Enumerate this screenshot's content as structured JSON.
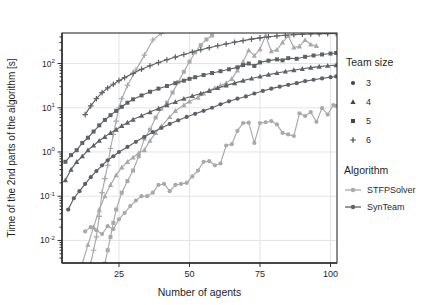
{
  "figure": {
    "width": 429,
    "height": 305,
    "background": "#ffffff",
    "panel_border_color": "#2f2f2f",
    "grid_color": "#e1e1e1",
    "tick_color": "#2f2f2f",
    "text_color": "#1f1f1f"
  },
  "chart_data": {
    "type": "line",
    "title": "",
    "xlabel": "Number of agents",
    "ylabel": "Time of the 2nd parts of the algorithm [s]",
    "x_ticks": [
      25,
      50,
      75,
      100
    ],
    "xlim": [
      4.8,
      102.3
    ],
    "y_scale": "log10",
    "y_tick_exponents": [
      -2,
      -1,
      0,
      1,
      2
    ],
    "ylim_log10": [
      -2.51,
      2.69
    ],
    "grid": "major",
    "legend_position": "right-outside",
    "series": [
      {
        "name": "STFPSolver team 3",
        "algorithm": "STFPSolver",
        "team_size": 3,
        "marker": "circle",
        "color": "#a9a9a9",
        "points": [
          [
            13,
            0.016
          ],
          [
            15,
            0.02
          ],
          [
            17,
            0.017
          ],
          [
            19,
            0.014
          ],
          [
            21,
            0.021
          ],
          [
            23,
            0.018
          ],
          [
            25,
            0.03
          ],
          [
            27,
            0.042
          ],
          [
            29,
            0.06
          ],
          [
            31,
            0.08
          ],
          [
            33,
            0.1
          ],
          [
            35,
            0.1
          ],
          [
            37,
            0.12
          ],
          [
            39,
            0.18
          ],
          [
            41,
            0.19
          ],
          [
            43,
            0.13
          ],
          [
            45,
            0.18
          ],
          [
            47,
            0.19
          ],
          [
            49,
            0.2
          ],
          [
            51,
            0.28
          ],
          [
            53,
            0.38
          ],
          [
            55,
            0.6
          ],
          [
            57,
            0.62
          ],
          [
            59,
            0.5
          ],
          [
            61,
            0.55
          ],
          [
            63,
            1.4
          ],
          [
            65,
            1.5
          ],
          [
            67,
            3
          ],
          [
            69,
            4.5
          ],
          [
            71,
            4.6
          ],
          [
            73,
            1.6
          ],
          [
            75,
            4.5
          ],
          [
            77,
            4.7
          ],
          [
            79,
            5
          ],
          [
            81,
            4.2
          ],
          [
            83,
            2.7
          ],
          [
            85,
            2.5
          ],
          [
            87,
            2.3
          ],
          [
            89,
            7.5
          ],
          [
            91,
            6.5
          ],
          [
            93,
            8
          ],
          [
            95,
            4.8
          ],
          [
            97,
            9.8
          ],
          [
            99,
            7
          ],
          [
            101,
            11.5
          ],
          [
            102,
            11
          ]
        ]
      },
      {
        "name": "STFPSolver team 4",
        "algorithm": "STFPSolver",
        "team_size": 4,
        "marker": "triangle",
        "color": "#a9a9a9",
        "points": [
          [
            12,
            0.003
          ],
          [
            14,
            0.008
          ],
          [
            16,
            0.02
          ],
          [
            18,
            0.05
          ],
          [
            20,
            0.1
          ],
          [
            22,
            0.18
          ],
          [
            24,
            0.3
          ],
          [
            26,
            0.45
          ],
          [
            28,
            0.6
          ],
          [
            30,
            0.75
          ],
          [
            32,
            0.95
          ],
          [
            34,
            1.1
          ],
          [
            36,
            1.8
          ],
          [
            38,
            2.7
          ],
          [
            40,
            3.8
          ],
          [
            43,
            6.2
          ],
          [
            45,
            8.5
          ],
          [
            48,
            11.5
          ],
          [
            50,
            14
          ],
          [
            53,
            17
          ],
          [
            55,
            21
          ],
          [
            57,
            25
          ],
          [
            59,
            28
          ],
          [
            61,
            32
          ],
          [
            63,
            36
          ],
          [
            65,
            45
          ],
          [
            67,
            70
          ],
          [
            69,
            110
          ],
          [
            71,
            200
          ],
          [
            73,
            150
          ],
          [
            75,
            210
          ],
          [
            77,
            430
          ],
          [
            79,
            190
          ],
          [
            81,
            205
          ],
          [
            83,
            300
          ],
          [
            85,
            420
          ],
          [
            87,
            230
          ],
          [
            89,
            245
          ],
          [
            91,
            340
          ],
          [
            93,
            270
          ],
          [
            95,
            250
          ]
        ]
      },
      {
        "name": "STFPSolver team 5",
        "algorithm": "STFPSolver",
        "team_size": 5,
        "marker": "square",
        "color": "#a9a9a9",
        "points": [
          [
            20,
            0.003
          ],
          [
            21,
            0.006
          ],
          [
            22,
            0.012
          ],
          [
            23,
            0.025
          ],
          [
            24,
            0.05
          ],
          [
            26,
            0.12
          ],
          [
            28,
            0.22
          ],
          [
            30,
            0.38
          ],
          [
            32,
            0.8
          ],
          [
            34,
            2
          ],
          [
            36,
            3.2
          ],
          [
            38,
            6
          ],
          [
            40,
            9.5
          ],
          [
            42,
            13
          ],
          [
            44,
            22
          ],
          [
            46,
            38
          ],
          [
            48,
            65
          ],
          [
            50,
            110
          ],
          [
            52,
            180
          ],
          [
            54,
            260
          ],
          [
            56,
            350
          ],
          [
            58,
            430
          ]
        ]
      },
      {
        "name": "STFPSolver team 6",
        "algorithm": "STFPSolver",
        "team_size": 6,
        "marker": "plus",
        "color": "#a9a9a9",
        "points": [
          [
            15,
            0.003
          ],
          [
            16,
            0.006
          ],
          [
            17,
            0.012
          ],
          [
            18,
            0.035
          ],
          [
            19,
            0.12
          ],
          [
            20,
            0.25
          ],
          [
            21,
            0.5
          ],
          [
            22,
            1.2
          ],
          [
            23,
            2.5
          ],
          [
            24,
            5
          ],
          [
            25,
            10
          ],
          [
            26,
            16
          ],
          [
            28,
            32
          ],
          [
            31,
            71
          ],
          [
            34,
            155
          ],
          [
            37,
            340
          ],
          [
            40,
            480
          ]
        ]
      },
      {
        "name": "SynTeam team 3",
        "algorithm": "SynTeam",
        "team_size": 3,
        "marker": "circle",
        "color": "#5e6266",
        "points": [
          [
            7,
            0.05
          ],
          [
            9,
            0.09
          ],
          [
            11,
            0.13
          ],
          [
            13,
            0.19
          ],
          [
            15,
            0.27
          ],
          [
            17,
            0.37
          ],
          [
            19,
            0.5
          ],
          [
            21,
            0.65
          ],
          [
            23,
            0.8
          ],
          [
            25,
            1
          ],
          [
            28,
            1.3
          ],
          [
            31,
            1.7
          ],
          [
            34,
            2.2
          ],
          [
            37,
            2.8
          ],
          [
            40,
            3.5
          ],
          [
            43,
            4.3
          ],
          [
            46,
            5.2
          ],
          [
            49,
            6.2
          ],
          [
            52,
            7.3
          ],
          [
            55,
            8.5
          ],
          [
            58,
            10
          ],
          [
            61,
            12
          ],
          [
            64,
            14
          ],
          [
            67,
            16
          ],
          [
            70,
            18
          ],
          [
            73,
            21
          ],
          [
            76,
            24
          ],
          [
            79,
            27
          ],
          [
            82,
            30
          ],
          [
            85,
            33
          ],
          [
            88,
            36
          ],
          [
            91,
            40
          ],
          [
            94,
            43
          ],
          [
            97,
            46
          ],
          [
            100,
            49
          ],
          [
            102,
            51
          ]
        ]
      },
      {
        "name": "SynTeam team 4",
        "algorithm": "SynTeam",
        "team_size": 4,
        "marker": "triangle",
        "color": "#5e6266",
        "points": [
          [
            6,
            0.23
          ],
          [
            8,
            0.4
          ],
          [
            10,
            0.6
          ],
          [
            12,
            0.8
          ],
          [
            14,
            1.1
          ],
          [
            16,
            1.4
          ],
          [
            18,
            1.8
          ],
          [
            20,
            2.2
          ],
          [
            22,
            2.7
          ],
          [
            24,
            3.2
          ],
          [
            26,
            3.9
          ],
          [
            28,
            4.6
          ],
          [
            30,
            5.4
          ],
          [
            33,
            6.6
          ],
          [
            36,
            8
          ],
          [
            39,
            9.6
          ],
          [
            42,
            11.5
          ],
          [
            45,
            13.5
          ],
          [
            48,
            16
          ],
          [
            51,
            18.5
          ],
          [
            54,
            21
          ],
          [
            57,
            24
          ],
          [
            60,
            28
          ],
          [
            63,
            32
          ],
          [
            66,
            36
          ],
          [
            69,
            41
          ],
          [
            72,
            46
          ],
          [
            75,
            51
          ],
          [
            78,
            56
          ],
          [
            81,
            61
          ],
          [
            84,
            66
          ],
          [
            87,
            71
          ],
          [
            90,
            76
          ],
          [
            93,
            81
          ],
          [
            96,
            85
          ],
          [
            99,
            89
          ],
          [
            102,
            92
          ]
        ]
      },
      {
        "name": "SynTeam team 5",
        "algorithm": "SynTeam",
        "team_size": 5,
        "marker": "square",
        "color": "#5e6266",
        "points": [
          [
            6,
            0.6
          ],
          [
            8,
            0.85
          ],
          [
            10,
            1.1
          ],
          [
            12,
            1.6
          ],
          [
            14,
            2.1
          ],
          [
            16,
            2.9
          ],
          [
            18,
            4
          ],
          [
            20,
            5.3
          ],
          [
            22,
            6.8
          ],
          [
            24,
            8.5
          ],
          [
            26,
            10.5
          ],
          [
            28,
            13
          ],
          [
            30,
            15.5
          ],
          [
            33,
            19
          ],
          [
            36,
            23
          ],
          [
            39,
            27
          ],
          [
            42,
            31
          ],
          [
            45,
            36
          ],
          [
            48,
            41
          ],
          [
            50,
            45
          ],
          [
            52,
            49
          ],
          [
            55,
            55
          ],
          [
            58,
            61
          ],
          [
            61,
            67
          ],
          [
            64,
            74
          ],
          [
            67,
            82
          ],
          [
            69,
            92
          ],
          [
            71,
            100
          ],
          [
            73,
            88
          ],
          [
            75,
            106
          ],
          [
            78,
            116
          ],
          [
            81,
            124
          ],
          [
            83,
            118
          ],
          [
            85,
            132
          ],
          [
            88,
            128
          ],
          [
            91,
            142
          ],
          [
            94,
            152
          ],
          [
            97,
            160
          ],
          [
            100,
            168
          ],
          [
            102,
            173
          ]
        ]
      },
      {
        "name": "SynTeam team 6",
        "algorithm": "SynTeam",
        "team_size": 6,
        "marker": "plus",
        "color": "#5e6266",
        "points": [
          [
            13,
            7
          ],
          [
            15,
            11
          ],
          [
            17,
            16
          ],
          [
            19,
            22
          ],
          [
            21,
            28
          ],
          [
            23,
            34
          ],
          [
            25,
            41
          ],
          [
            27,
            48
          ],
          [
            30,
            60
          ],
          [
            33,
            74
          ],
          [
            36,
            89
          ],
          [
            39,
            105
          ],
          [
            42,
            122
          ],
          [
            45,
            140
          ],
          [
            48,
            160
          ],
          [
            51,
            182
          ],
          [
            54,
            205
          ],
          [
            57,
            228
          ],
          [
            60,
            252
          ],
          [
            63,
            277
          ],
          [
            66,
            303
          ],
          [
            69,
            330
          ],
          [
            72,
            356
          ],
          [
            75,
            380
          ],
          [
            78,
            402
          ],
          [
            81,
            420
          ],
          [
            84,
            436
          ],
          [
            87,
            448
          ],
          [
            90,
            458
          ],
          [
            93,
            465
          ],
          [
            96,
            470
          ],
          [
            99,
            474
          ],
          [
            102,
            476
          ]
        ]
      }
    ]
  },
  "legend": {
    "team_size": {
      "title": "Team size",
      "marker_color": "#454545",
      "items": [
        {
          "label": "3",
          "marker": "circle"
        },
        {
          "label": "4",
          "marker": "triangle"
        },
        {
          "label": "5",
          "marker": "square"
        },
        {
          "label": "6",
          "marker": "plus"
        }
      ]
    },
    "algorithm": {
      "title": "Algorithm",
      "items": [
        {
          "label": "STFPSolver",
          "color": "#a9a9a9"
        },
        {
          "label": "SynTeam",
          "color": "#5e6266"
        }
      ]
    }
  }
}
